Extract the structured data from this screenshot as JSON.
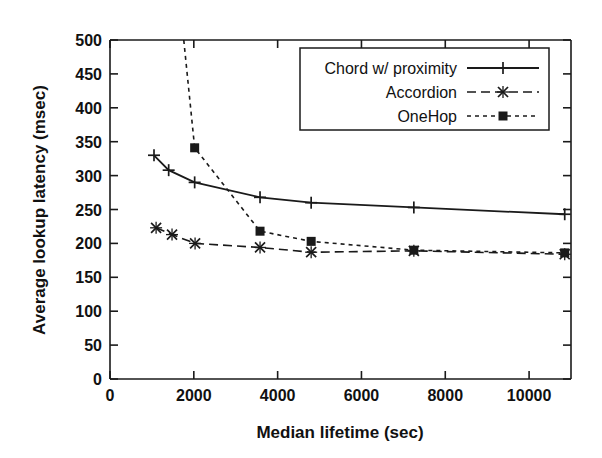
{
  "chart_data": {
    "type": "line",
    "title": "",
    "xlabel": "Median lifetime (sec)",
    "ylabel": "Average lookup latency (msec)",
    "xlim": [
      0,
      11000
    ],
    "ylim": [
      0,
      500
    ],
    "xticks": [
      0,
      2000,
      4000,
      6000,
      8000,
      10000
    ],
    "xtick_labels": [
      "0",
      "2000",
      "4000",
      "6000",
      "8000",
      "10000"
    ],
    "yticks": [
      0,
      50,
      100,
      150,
      200,
      250,
      300,
      350,
      400,
      450,
      500
    ],
    "ytick_labels": [
      "0",
      "50",
      "100",
      "150",
      "200",
      "250",
      "300",
      "350",
      "400",
      "450",
      "500"
    ],
    "grid": false,
    "legend_position": "upper right",
    "series": [
      {
        "name": "Chord w/ proximity",
        "style": "solid",
        "marker": "plus",
        "color": "#1a1a1a",
        "points": [
          {
            "x": 1050,
            "y": 330
          },
          {
            "x": 1400,
            "y": 308
          },
          {
            "x": 2020,
            "y": 290
          },
          {
            "x": 3580,
            "y": 268
          },
          {
            "x": 4800,
            "y": 260
          },
          {
            "x": 7250,
            "y": 253
          },
          {
            "x": 10850,
            "y": 243
          }
        ]
      },
      {
        "name": "Accordion",
        "style": "dashed",
        "marker": "cross",
        "color": "#1a1a1a",
        "points": [
          {
            "x": 1100,
            "y": 223
          },
          {
            "x": 1480,
            "y": 213
          },
          {
            "x": 2030,
            "y": 200
          },
          {
            "x": 3580,
            "y": 194
          },
          {
            "x": 4800,
            "y": 187
          },
          {
            "x": 7250,
            "y": 189
          },
          {
            "x": 10850,
            "y": 184
          }
        ]
      },
      {
        "name": "OneHop",
        "style": "dotted",
        "marker": "square",
        "color": "#1a1a1a",
        "points": [
          {
            "x": 1760,
            "y": 500
          },
          {
            "x": 2020,
            "y": 341
          },
          {
            "x": 3580,
            "y": 218
          },
          {
            "x": 4800,
            "y": 203
          },
          {
            "x": 7250,
            "y": 190
          },
          {
            "x": 10850,
            "y": 186
          }
        ]
      }
    ]
  },
  "legend": {
    "entries": [
      {
        "label": "Chord w/ proximity",
        "style": "solid",
        "marker": "plus"
      },
      {
        "label": "Accordion",
        "style": "dashed",
        "marker": "cross"
      },
      {
        "label": "OneHop",
        "style": "dotted",
        "marker": "square"
      }
    ]
  },
  "colors": {
    "ink": "#1a1a1a",
    "background": "#ffffff"
  }
}
